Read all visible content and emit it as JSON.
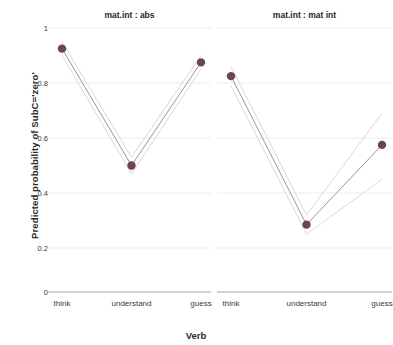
{
  "chart_data": {
    "type": "line",
    "title": "",
    "xlabel": "Verb",
    "ylabel": "Predicted probability of SubC='zero'",
    "categories": [
      "think",
      "understand",
      "guess"
    ],
    "ylim": [
      0,
      1
    ],
    "yticks": [
      "1",
      "0.8",
      "0.6",
      "0.4",
      "0.2",
      "0"
    ],
    "ytick_values": [
      1,
      0.8,
      0.6,
      0.4,
      0.2,
      0
    ],
    "grid": true,
    "legend": "none",
    "axis_break_below": 0.2,
    "panels": [
      {
        "title": "mat.int : abs",
        "series": [
          {
            "name": "predicted probability",
            "values": [
              0.925,
              0.5,
              0.875
            ],
            "ci_upper": [
              0.95,
              0.53,
              0.9
            ],
            "ci_lower": [
              0.9,
              0.47,
              0.85
            ]
          }
        ]
      },
      {
        "title": "mat.int : mat int",
        "series": [
          {
            "name": "predicted probability",
            "values": [
              0.825,
              0.285,
              0.575
            ],
            "ci_upper": [
              0.86,
              0.32,
              0.69
            ],
            "ci_lower": [
              0.79,
              0.25,
              0.45
            ]
          }
        ]
      }
    ],
    "colors": {
      "point": "#6b4550",
      "line": "#8b8b8b",
      "ci_line": "#d8c9ce",
      "gridline": "#e3f2f1",
      "axis": "#9a9a9a",
      "text": "#2b2b2b"
    }
  }
}
